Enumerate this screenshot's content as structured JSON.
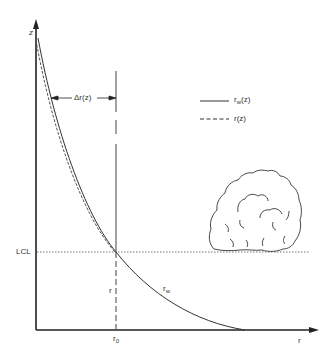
{
  "axes": {
    "y_label": "z",
    "x_label": "r"
  },
  "annotations": {
    "delta_r": "Δr(z)",
    "lcl": "LCL",
    "r_curve": "r",
    "rw_base": "r",
    "rw_sub": "w",
    "r0_base": "r",
    "r0_sub": "0"
  },
  "legend": {
    "solid": {
      "base": "r",
      "sub": "w",
      "rest": "(z)"
    },
    "dashed": {
      "label": "r(z)"
    }
  },
  "colors": {
    "line": "#333333",
    "axis": "#222222",
    "dotted": "#777777"
  }
}
